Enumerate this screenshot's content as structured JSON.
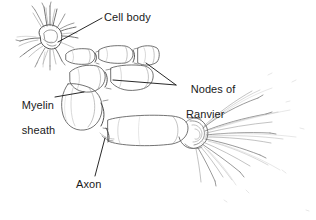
{
  "figure": {
    "style": "pencil line drawing",
    "background_color": "#ffffff",
    "ink_color": "#4a4a4a",
    "label_color": "#1a1a1a",
    "width": 316,
    "height": 220
  },
  "labels": {
    "cell_body": "Cell body",
    "nodes_of_ranvier_line1": "Nodes of",
    "nodes_of_ranvier_line2": "Ranvier",
    "myelin_sheath_line1": "Myelin",
    "myelin_sheath_line2": "sheath",
    "axon": "Axon"
  },
  "parts": [
    {
      "name": "cell-body",
      "label": "Cell body",
      "description": "star-shaped soma with radiating dendrites, upper-left",
      "leader_from": [
        102,
        18
      ],
      "leader_to": [
        58,
        42
      ]
    },
    {
      "name": "nodes-of-ranvier",
      "label": "Nodes of Ranvier",
      "description": "constrictions between myelin segments",
      "leader_from": [
        176,
        85
      ],
      "leader_to": [
        113,
        80
      ],
      "leader_from_2": [
        176,
        85
      ],
      "leader_to_2": [
        145,
        63
      ]
    },
    {
      "name": "myelin-sheath",
      "label": "Myelin sheath",
      "description": "segmented insulating sleeve along the axon",
      "leader_from": [
        55,
        97
      ],
      "leader_to": [
        84,
        93
      ]
    },
    {
      "name": "axon",
      "label": "Axon",
      "description": "nerve fiber inside the myelin sheath",
      "leader_from": [
        95,
        176
      ],
      "leader_to": [
        104,
        139
      ]
    },
    {
      "name": "axon-terminals",
      "label": "",
      "description": "spray of terminal branches at the right end"
    }
  ]
}
